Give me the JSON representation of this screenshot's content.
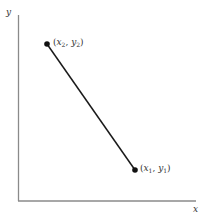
{
  "diagram": {
    "type": "line-segment-on-cartesian-axes",
    "axes": {
      "x_label": "x",
      "y_label": "y",
      "color": "#8a8a8a"
    },
    "segment": {
      "color": "#1a1a1a"
    },
    "points": [
      {
        "id": "p2",
        "label_var_x": "x",
        "label_sub_x": "2",
        "label_var_y": "y",
        "label_sub_y": "2",
        "label_text": "(x2, y2)"
      },
      {
        "id": "p1",
        "label_var_x": "x",
        "label_sub_x": "1",
        "label_var_y": "y",
        "label_sub_y": "1",
        "label_text": "(x1, y1)"
      }
    ],
    "punct": {
      "open": "(",
      "comma": ", ",
      "close": ")"
    }
  }
}
